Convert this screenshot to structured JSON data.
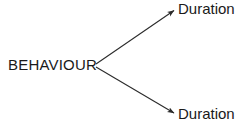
{
  "diagram": {
    "type": "branching-arrow-diagram",
    "background_color": "#ffffff",
    "line_color": "#2b2b2b",
    "text_color": "#1a1a1a",
    "source": {
      "label": "BEHAVIOUR"
    },
    "targets": [
      {
        "label": "Duration",
        "position": "top"
      },
      {
        "label": "Duration",
        "position": "bottom"
      }
    ],
    "edges": [
      {
        "from": "BEHAVIOUR",
        "to": "Duration",
        "direction": "up-right",
        "arrowhead": true
      },
      {
        "from": "BEHAVIOUR",
        "to": "Duration",
        "direction": "down-right",
        "arrowhead": true
      }
    ]
  }
}
